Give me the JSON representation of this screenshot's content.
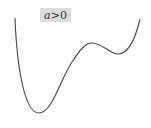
{
  "label": {
    "variable": "a",
    "relation": ">0"
  },
  "curve": {
    "description": "quartic-like potential curve with global minimum on left and shallower local minimum on right",
    "color": "#444444",
    "points": [
      [
        15,
        18
      ],
      [
        39,
        113
      ],
      [
        90,
        43
      ],
      [
        118,
        54
      ],
      [
        140,
        19
      ]
    ]
  }
}
